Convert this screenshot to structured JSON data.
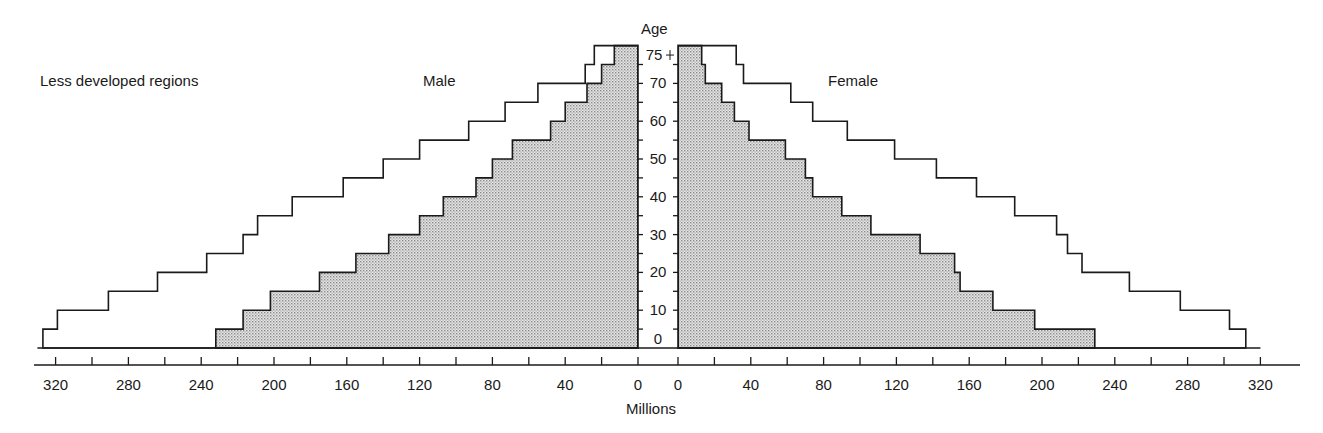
{
  "chart_data": {
    "type": "bar",
    "subtype": "population-pyramid",
    "title": "Less developed regions",
    "xlabel": "Millions",
    "ylabel": "Age",
    "left_label": "Male",
    "right_label": "Female",
    "categories": [
      "0-4",
      "5-9",
      "10-14",
      "15-19",
      "20-24",
      "25-29",
      "30-34",
      "35-39",
      "40-44",
      "45-49",
      "50-54",
      "55-59",
      "60-64",
      "65-69",
      "70-74",
      "75+"
    ],
    "age_ticks": [
      "0",
      "10",
      "20",
      "30",
      "40",
      "50",
      "60",
      "70",
      "75 +"
    ],
    "x_ticks": [
      0,
      40,
      80,
      120,
      160,
      200,
      240,
      280,
      320
    ],
    "xlim": [
      0,
      340
    ],
    "series": [
      {
        "name": "Male (outer profile)",
        "side": "left",
        "fill": "none",
        "values": [
          327,
          319,
          291,
          264,
          237,
          217,
          209,
          190,
          162,
          140,
          120,
          93,
          73,
          55,
          29,
          24
        ]
      },
      {
        "name": "Male (shaded)",
        "side": "left",
        "fill": "dotted",
        "values": [
          232,
          217,
          202,
          175,
          155,
          137,
          120,
          107,
          89,
          80,
          69,
          48,
          40,
          28,
          20,
          13
        ]
      },
      {
        "name": "Female (outer profile)",
        "side": "right",
        "fill": "none",
        "values": [
          312,
          303,
          276,
          248,
          222,
          214,
          208,
          185,
          164,
          142,
          119,
          93,
          74,
          62,
          36,
          32
        ]
      },
      {
        "name": "Female (shaded)",
        "side": "right",
        "fill": "dotted",
        "values": [
          229,
          196,
          173,
          155,
          152,
          133,
          106,
          90,
          74,
          70,
          59,
          39,
          31,
          24,
          15,
          13
        ]
      }
    ],
    "grid": false,
    "colors": {
      "line": "#1a1a1a",
      "shade": "#d4d4d4",
      "background": "#ffffff"
    }
  },
  "labels": {
    "region": "Less developed regions",
    "male": "Male",
    "female": "Female",
    "age": "Age",
    "millions": "Millions"
  }
}
